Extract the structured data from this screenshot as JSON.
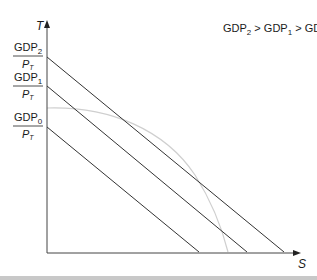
{
  "diagram": {
    "axes": {
      "y_label": "T",
      "x_label": "S"
    },
    "relation_label": {
      "parts": [
        "GDP",
        "2",
        " > GDP",
        "1",
        " > GDP",
        "0"
      ]
    },
    "budget_lines": [
      {
        "name": "GDP2",
        "num": "GDP",
        "sub": "2",
        "den": "P",
        "den_sub": "T",
        "y_intercept_px": 57,
        "x_intercept_px": 284
      },
      {
        "name": "GDP1",
        "num": "GDP",
        "sub": "1",
        "den": "P",
        "den_sub": "T",
        "y_intercept_px": 86,
        "x_intercept_px": 247
      },
      {
        "name": "GDP0",
        "num": "GDP",
        "sub": "0",
        "den": "P",
        "den_sub": "T",
        "y_intercept_px": 127,
        "x_intercept_px": 199
      }
    ],
    "curve": {
      "name": "production-possibility-frontier",
      "color": "#c9c9c9"
    },
    "colors": {
      "line": "#333333",
      "axis": "#444444",
      "curve": "#cccccc"
    }
  }
}
